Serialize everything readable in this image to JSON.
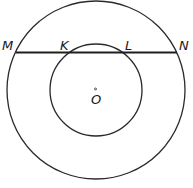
{
  "diagram": {
    "labels": {
      "M": "M",
      "K": "K",
      "L": "L",
      "N": "N",
      "O": "O"
    },
    "outer_circle": {
      "cx": 96,
      "cy": 90,
      "r": 89
    },
    "inner_circle": {
      "cx": 96,
      "cy": 90,
      "r": 46
    },
    "chord": {
      "x1": 16,
      "y1": 52,
      "x2": 177,
      "y2": 52
    },
    "stroke_color": "#2a2a2a"
  }
}
